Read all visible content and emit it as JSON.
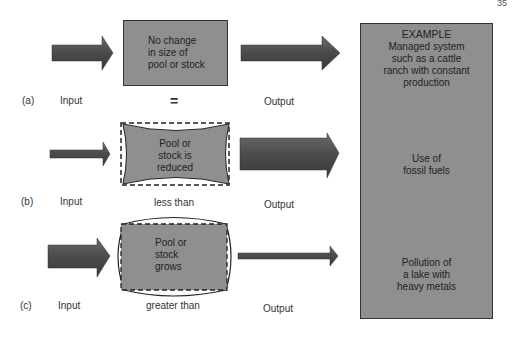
{
  "page_number": "35",
  "rows": [
    {
      "letter": "(a)",
      "input_label": "Input",
      "relation": "=",
      "output_label": "Output",
      "pool_text": [
        "No change",
        "in size of",
        "pool or stock"
      ],
      "example_text": [
        "Managed system",
        "such as a cattle",
        "ranch with constant",
        "production"
      ]
    },
    {
      "letter": "(b)",
      "input_label": "Input",
      "relation": "less than",
      "output_label": "Output",
      "pool_text": [
        "Pool or",
        "stock is",
        "reduced"
      ],
      "example_text": [
        "Use of",
        "fossil fuels"
      ]
    },
    {
      "letter": "(c)",
      "input_label": "Input",
      "relation": "greater than",
      "output_label": "Output",
      "pool_text": [
        "Pool or",
        "stock",
        "grows"
      ],
      "example_text": [
        "Pollution of",
        "a lake with",
        "heavy metals"
      ]
    }
  ],
  "example_header": "EXAMPLE",
  "colors": {
    "fill": "#8f8f8f",
    "arrow": "#555555",
    "stroke": "#222222"
  }
}
